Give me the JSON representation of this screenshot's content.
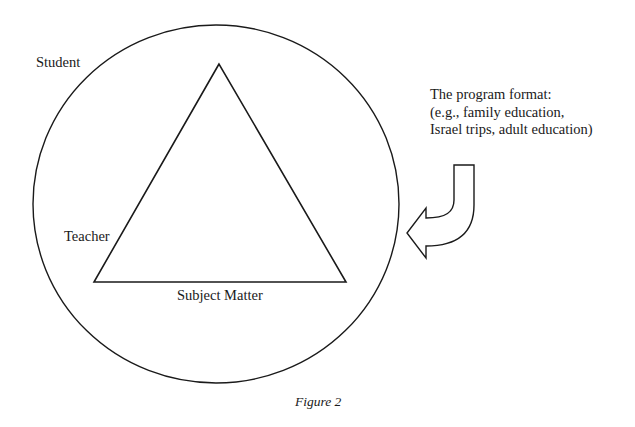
{
  "figure": {
    "caption": "Figure 2",
    "labels": {
      "student": "Student",
      "teacher": "Teacher",
      "subject_matter": "Subject Matter"
    },
    "program_format": {
      "line1": "The program format:",
      "line2": "(e.g., family education,",
      "line3": "Israel trips, adult education)"
    },
    "shapes": {
      "outer": "circle",
      "inner": "triangle",
      "pointer": "curved-arrow-left"
    },
    "colors": {
      "stroke": "#1a1a1a",
      "background": "#ffffff"
    }
  }
}
